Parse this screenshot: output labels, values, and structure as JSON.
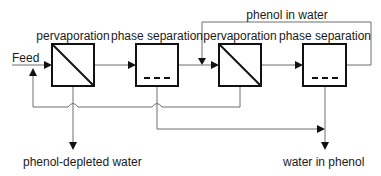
{
  "diagram": {
    "units": [
      {
        "id": "perv1",
        "label": "pervaporation",
        "type": "pervaporation"
      },
      {
        "id": "sep1",
        "label": "phase separation",
        "type": "phase-separation"
      },
      {
        "id": "perv2",
        "label": "pervaporation",
        "type": "pervaporation"
      },
      {
        "id": "sep2",
        "label": "phase separation",
        "type": "phase-separation"
      }
    ],
    "streams": {
      "feed": "Feed",
      "recycle_top": "phenol in water",
      "product_left": "phenol-depleted water",
      "product_right": "water in phenol"
    },
    "colors": {
      "box_stroke": "#111111",
      "line": "#6e6e6e",
      "text": "#1a1a1a",
      "background": "#ffffff"
    }
  }
}
